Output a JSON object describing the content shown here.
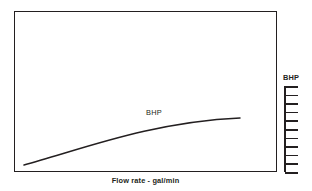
{
  "figure": {
    "background_color": "#ffffff",
    "ink_color": "#231f20",
    "width": 312,
    "height": 191
  },
  "plot": {
    "frame": {
      "x": 14,
      "y": 11,
      "width": 263,
      "height": 161,
      "border_width": 1.6
    }
  },
  "xaxis": {
    "label": "Flow rate  -  gal/min",
    "ticks": [],
    "tick_labels": []
  },
  "secondary_axis": {
    "title": "BHP",
    "spine": {
      "x": 284,
      "y": 86,
      "height": 86
    },
    "tick_count": 11,
    "tick_length": 13,
    "tick_positions": [
      0,
      8.6,
      17.2,
      25.8,
      34.4,
      43.0,
      51.6,
      60.2,
      68.8,
      77.4,
      86
    ],
    "tick_labels": []
  },
  "annotations": [
    {
      "text": "BHP",
      "x": 146,
      "y": 108
    }
  ],
  "chart_data": {
    "type": "line",
    "title": "",
    "subtitle": "",
    "xlabel": "Flow rate  -  gal/min",
    "ylabel": "BHP",
    "grid": false,
    "legend_position": "none",
    "xlim": [
      0,
      1
    ],
    "ylim": [
      0,
      1
    ],
    "axis_tick_labels_shown": false,
    "series": [
      {
        "name": "BHP",
        "label_on_curve": "BHP",
        "comment": "Brake horsepower rises with flow rate, concave-down (rate of increase diminishes).",
        "x": [
          0.038,
          0.1,
          0.17,
          0.24,
          0.31,
          0.39,
          0.46,
          0.53,
          0.61,
          0.68,
          0.75,
          0.82,
          0.86
        ],
        "y": [
          0.045,
          0.115,
          0.18,
          0.243,
          0.3,
          0.357,
          0.406,
          0.45,
          0.492,
          0.527,
          0.558,
          0.583,
          0.596
        ],
        "pixel_points": [
          [
            24,
            165
          ],
          [
            42,
            157
          ],
          [
            60,
            149
          ],
          [
            78,
            141
          ],
          [
            96,
            134
          ],
          [
            114,
            127
          ],
          [
            132,
            121
          ],
          [
            150,
            116
          ],
          [
            168,
            111
          ],
          [
            186,
            107
          ],
          [
            204,
            103
          ],
          [
            222,
            100
          ],
          [
            240,
            118
          ]
        ],
        "path_pixels": {
          "start": [
            24,
            165
          ],
          "end": [
            240,
            118
          ],
          "control_1": [
            80,
            150
          ],
          "control_2": [
            150,
            122
          ]
        },
        "line_width": 1.5,
        "color": "#231f20"
      }
    ]
  }
}
